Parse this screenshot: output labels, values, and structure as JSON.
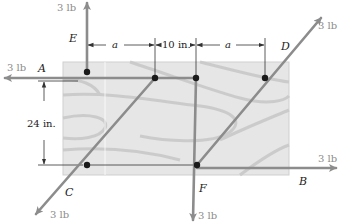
{
  "diagram": {
    "type": "statics-couple-board",
    "board": {
      "x": 63,
      "y": 62,
      "width": 226,
      "height": 113,
      "fill": "#e4e4e4",
      "grain": "#c8c8c8"
    },
    "colors": {
      "force_line": "#8c8c8c",
      "pin": "#1a1a1a",
      "dim_line": "#333333",
      "label": "#222222",
      "force_label": "#8a8a8a"
    },
    "forces": [
      {
        "point": "A",
        "magnitude_label": "3 lb",
        "direction": "left"
      },
      {
        "point": "B",
        "magnitude_label": "3 lb",
        "direction": "right"
      },
      {
        "point": "C",
        "magnitude_label": "3 lb",
        "direction": "down-left"
      },
      {
        "point": "D",
        "magnitude_label": "3 lb",
        "direction": "up-right"
      },
      {
        "point": "E",
        "magnitude_label": "3 lb",
        "direction": "up"
      },
      {
        "point": "F",
        "magnitude_label": "3 lb",
        "direction": "down"
      }
    ],
    "labels": {
      "A": "A",
      "B": "B",
      "C": "C",
      "D": "D",
      "E": "E",
      "F": "F",
      "force_A": "3 lb",
      "force_B": "3 lb",
      "force_C": "3 lb",
      "force_D": "3 lb",
      "force_E": "3 lb",
      "force_F": "3 lb"
    },
    "dimensions": {
      "horizontal": [
        "a",
        "10 in.",
        "a"
      ],
      "dim_a_left": "a",
      "dim_mid": "10 in.",
      "dim_a_right": "a",
      "vertical": "24 in."
    },
    "pins": [
      {
        "name": "pin-E",
        "x": 87,
        "y": 72
      },
      {
        "name": "pin-A-C",
        "x": 155,
        "y": 78
      },
      {
        "name": "pin-F",
        "x": 196,
        "y": 78
      },
      {
        "name": "pin-D",
        "x": 265,
        "y": 78
      },
      {
        "name": "pin-C",
        "x": 87,
        "y": 165
      },
      {
        "name": "pin-B-D",
        "x": 197,
        "y": 165
      }
    ]
  }
}
